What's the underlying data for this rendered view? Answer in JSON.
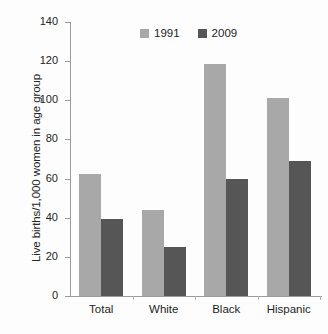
{
  "chart_data": {
    "type": "bar",
    "title": "",
    "subtitle": "",
    "xlabel": "",
    "ylabel": "Live births/1,000 women in age group",
    "categories": [
      "Total",
      "White",
      "Black",
      "Hispanic"
    ],
    "series": [
      {
        "name": "1991",
        "color": "#a8a8a8",
        "values": [
          62.5,
          44,
          118.5,
          101
        ]
      },
      {
        "name": "2009",
        "color": "#565656",
        "values": [
          39.5,
          25,
          60,
          69
        ]
      }
    ],
    "ylim": [
      0,
      140
    ],
    "ytick_values": [
      0,
      20,
      40,
      60,
      80,
      100,
      120,
      140
    ],
    "ytick_labels": [
      "0",
      "20",
      "40",
      "60",
      "80",
      "100",
      "120",
      "140"
    ],
    "grid": false,
    "legend_position": "top-center",
    "legend_orientation": "horizontal",
    "annotations": []
  },
  "figure": {
    "background_color": "#fdfdfd",
    "axis_color": "#9a9a9a",
    "text_color": "#242424"
  }
}
